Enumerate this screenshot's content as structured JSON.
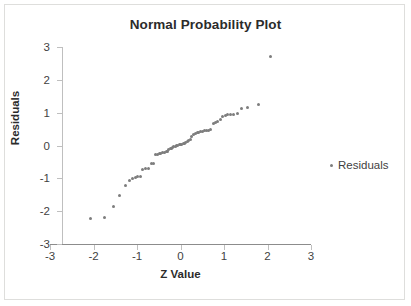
{
  "chart_data": {
    "type": "scatter",
    "title": "Normal Probability Plot",
    "xlabel": "Z Value",
    "ylabel": "Residuals",
    "xlim": [
      -3,
      3
    ],
    "ylim": [
      -3,
      3
    ],
    "xticks": [
      "-3",
      "-2",
      "-1",
      "0",
      "1",
      "2",
      "3"
    ],
    "yticks": [
      "3",
      "2",
      "1",
      "0",
      "-1",
      "-2",
      "-3"
    ],
    "xtick_values": [
      -3,
      -2,
      -1,
      0,
      1,
      2,
      3
    ],
    "ytick_values": [
      3,
      2,
      1,
      0,
      -1,
      -2,
      -3
    ],
    "grid": false,
    "legend_position": "right",
    "series": [
      {
        "name": "Residuals",
        "marker": "dot",
        "color": "#7d7d7d",
        "points": [
          [
            -2.08,
            -2.22
          ],
          [
            -1.75,
            -2.18
          ],
          [
            -1.55,
            -1.86
          ],
          [
            -1.41,
            -1.53
          ],
          [
            -1.27,
            -1.21
          ],
          [
            -1.17,
            -1.07
          ],
          [
            -1.1,
            -0.99
          ],
          [
            -1.04,
            -0.96
          ],
          [
            -0.98,
            -0.94
          ],
          [
            -0.93,
            -0.93
          ],
          [
            -0.87,
            -0.73
          ],
          [
            -0.8,
            -0.7
          ],
          [
            -0.74,
            -0.69
          ],
          [
            -0.66,
            -0.55
          ],
          [
            -0.61,
            -0.54
          ],
          [
            -0.57,
            -0.27
          ],
          [
            -0.53,
            -0.26
          ],
          [
            -0.49,
            -0.25
          ],
          [
            -0.45,
            -0.24
          ],
          [
            -0.41,
            -0.22
          ],
          [
            -0.37,
            -0.21
          ],
          [
            -0.33,
            -0.19
          ],
          [
            -0.3,
            -0.17
          ],
          [
            -0.27,
            -0.13
          ],
          [
            -0.24,
            -0.1
          ],
          [
            -0.21,
            -0.08
          ],
          [
            -0.18,
            -0.06
          ],
          [
            -0.15,
            -0.04
          ],
          [
            -0.12,
            -0.02
          ],
          [
            -0.09,
            0.0
          ],
          [
            -0.06,
            0.01
          ],
          [
            -0.03,
            0.02
          ],
          [
            0.0,
            0.03
          ],
          [
            0.03,
            0.04
          ],
          [
            0.06,
            0.05
          ],
          [
            0.09,
            0.06
          ],
          [
            0.12,
            0.08
          ],
          [
            0.15,
            0.11
          ],
          [
            0.18,
            0.14
          ],
          [
            0.22,
            0.18
          ],
          [
            0.26,
            0.26
          ],
          [
            0.3,
            0.33
          ],
          [
            0.34,
            0.38
          ],
          [
            0.38,
            0.4
          ],
          [
            0.42,
            0.41
          ],
          [
            0.46,
            0.42
          ],
          [
            0.5,
            0.44
          ],
          [
            0.55,
            0.45
          ],
          [
            0.6,
            0.46
          ],
          [
            0.65,
            0.47
          ],
          [
            0.7,
            0.48
          ],
          [
            0.75,
            0.68
          ],
          [
            0.8,
            0.71
          ],
          [
            0.86,
            0.74
          ],
          [
            0.92,
            0.79
          ],
          [
            0.97,
            0.88
          ],
          [
            1.03,
            0.9
          ],
          [
            1.09,
            0.94
          ],
          [
            1.15,
            0.95
          ],
          [
            1.22,
            0.95
          ],
          [
            1.3,
            0.97
          ],
          [
            1.4,
            1.14
          ],
          [
            1.54,
            1.16
          ],
          [
            1.79,
            1.26
          ],
          [
            2.08,
            2.7
          ]
        ]
      }
    ]
  },
  "legend": {
    "entries": [
      {
        "label": "Residuals"
      }
    ]
  }
}
